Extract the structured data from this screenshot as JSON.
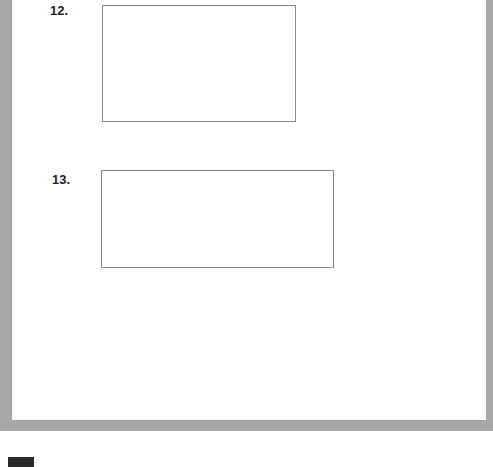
{
  "questions": [
    {
      "number": "12.",
      "answer": ""
    },
    {
      "number": "13.",
      "answer": ""
    }
  ],
  "colors": {
    "frame": "#a8a8a8",
    "box_border": "#8a8a8a",
    "tab_mark": "#2a2a2a"
  }
}
